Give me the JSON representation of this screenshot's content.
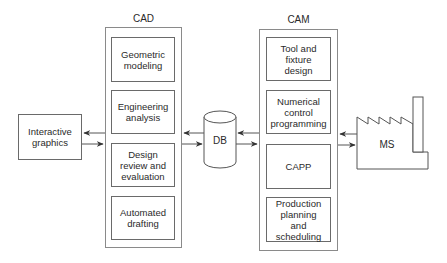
{
  "diagram": {
    "interactive_graphics": {
      "label": "Interactive\ngraphics"
    },
    "cad": {
      "title": "CAD",
      "modules": [
        {
          "label": "Geometric\nmodeling"
        },
        {
          "label": "Engineering\nanalysis"
        },
        {
          "label": "Design\nreview and\nevaluation"
        },
        {
          "label": "Automated\ndrafting"
        }
      ]
    },
    "database": {
      "label": "DB"
    },
    "cam": {
      "title": "CAM",
      "modules": [
        {
          "label": "Tool and\nfixture\ndesign"
        },
        {
          "label": "Numerical\ncontrol\nprogramming"
        },
        {
          "label": "CAPP"
        },
        {
          "label": "Production\nplanning\nand\nscheduling"
        }
      ]
    },
    "manufacturing_system": {
      "label": "MS"
    },
    "connections": [
      {
        "from": "CAD",
        "to": "Interactive graphics"
      },
      {
        "from": "Interactive graphics",
        "to": "CAD"
      },
      {
        "from": "DB",
        "to": "CAD"
      },
      {
        "from": "CAD",
        "to": "DB"
      },
      {
        "from": "CAM",
        "to": "DB"
      },
      {
        "from": "DB",
        "to": "CAM"
      },
      {
        "from": "MS",
        "to": "CAM"
      },
      {
        "from": "CAM",
        "to": "MS"
      }
    ],
    "colors": {
      "stroke": "#5a5a5a",
      "text": "#2a2a2a",
      "background": "#ffffff"
    }
  }
}
